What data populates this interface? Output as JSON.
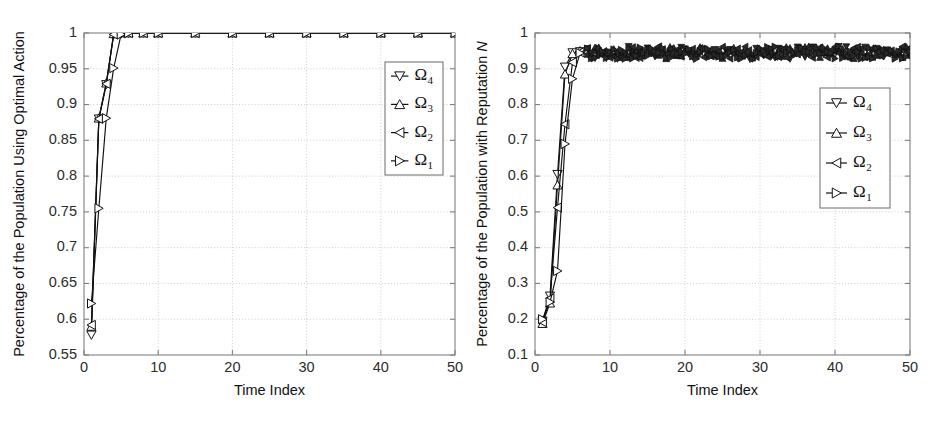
{
  "figure": {
    "background": "#ffffff",
    "panel_count": 2,
    "line_color": "#111111",
    "grid_color": "#c8c8c8",
    "axis_color": "#808080"
  },
  "chart_data": [
    {
      "id": "left",
      "type": "line",
      "title": "",
      "xlabel": "Time Index",
      "ylabel": "Percentage of the Population Using Optimal Action",
      "ylabel_italic_suffix": "",
      "xlim": [
        0,
        50
      ],
      "ylim": [
        0.55,
        1.0
      ],
      "xticks": [
        0,
        10,
        20,
        30,
        40,
        50
      ],
      "xticklabels": [
        "0",
        "10",
        "20",
        "30",
        "40",
        "50"
      ],
      "yticks": [
        0.55,
        0.6,
        0.65,
        0.7,
        0.75,
        0.8,
        0.85,
        0.9,
        0.95,
        1
      ],
      "yticklabels": [
        "0.55",
        "0.6",
        "0.65",
        "0.7",
        "0.75",
        "0.8",
        "0.85",
        "0.9",
        "0.95",
        "1"
      ],
      "grid": true,
      "grid_style": "dotted",
      "legend_position": "upper-right-inset",
      "series": [
        {
          "name": "Ω4",
          "marker": "triangle-down",
          "x": [
            1,
            2,
            3,
            4,
            5,
            6,
            8,
            10,
            15,
            20,
            25,
            30,
            35,
            40,
            45,
            50
          ],
          "y": [
            0.578,
            0.88,
            0.928,
            0.998,
            0.999,
            1.0,
            1.0,
            1.0,
            1.0,
            1.0,
            1.0,
            1.0,
            1.0,
            1.0,
            1.0,
            1.0
          ]
        },
        {
          "name": "Ω3",
          "marker": "triangle-up",
          "x": [
            1,
            2,
            3,
            4,
            5,
            6,
            8,
            10,
            15,
            20,
            25,
            30,
            35,
            40,
            45,
            50
          ],
          "y": [
            0.59,
            0.881,
            0.93,
            0.999,
            1.0,
            1.0,
            1.0,
            1.0,
            1.0,
            1.0,
            1.0,
            1.0,
            1.0,
            1.0,
            1.0,
            1.0
          ]
        },
        {
          "name": "Ω2",
          "marker": "triangle-left",
          "x": [
            1,
            2,
            3,
            4,
            5,
            6,
            8,
            10,
            15,
            20,
            25,
            30,
            35,
            40,
            45,
            50
          ],
          "y": [
            0.592,
            0.88,
            0.929,
            0.998,
            1.0,
            1.0,
            1.0,
            1.0,
            1.0,
            1.0,
            1.0,
            1.0,
            1.0,
            1.0,
            1.0,
            1.0
          ]
        },
        {
          "name": "Ω1",
          "marker": "triangle-right",
          "x": [
            1,
            2,
            3,
            4,
            5,
            6,
            8,
            10,
            15,
            20,
            25,
            30,
            35,
            40,
            45,
            50
          ],
          "y": [
            0.622,
            0.755,
            0.881,
            0.951,
            0.998,
            1.0,
            1.0,
            1.0,
            1.0,
            1.0,
            1.0,
            1.0,
            1.0,
            1.0,
            1.0,
            1.0
          ]
        }
      ]
    },
    {
      "id": "right",
      "type": "line",
      "title": "",
      "xlabel": "Time Index",
      "ylabel": "Percentage of the Population with Reputation ",
      "ylabel_italic_suffix": "N",
      "xlim": [
        0,
        50
      ],
      "ylim": [
        0.1,
        1.0
      ],
      "xticks": [
        0,
        10,
        20,
        30,
        40,
        50
      ],
      "xticklabels": [
        "0",
        "10",
        "20",
        "30",
        "40",
        "50"
      ],
      "yticks": [
        0.1,
        0.2,
        0.3,
        0.4,
        0.5,
        0.6,
        0.7,
        0.8,
        0.9,
        1
      ],
      "yticklabels": [
        "0.1",
        "0.2",
        "0.3",
        "0.4",
        "0.5",
        "0.6",
        "0.7",
        "0.8",
        "0.9",
        "1"
      ],
      "grid": true,
      "grid_style": "dotted",
      "legend_position": "right-inset",
      "plateau_level": 0.945,
      "plateau_noise": 0.018,
      "series": [
        {
          "name": "Ω4",
          "marker": "triangle-down",
          "x": [
            1,
            2,
            3,
            4,
            5,
            6
          ],
          "y": [
            0.195,
            0.265,
            0.605,
            0.905,
            0.945,
            0.948
          ]
        },
        {
          "name": "Ω3",
          "marker": "triangle-up",
          "x": [
            1,
            2,
            3,
            4,
            5,
            6
          ],
          "y": [
            0.188,
            0.245,
            0.575,
            0.885,
            0.942,
            0.95
          ]
        },
        {
          "name": "Ω2",
          "marker": "triangle-left",
          "x": [
            1,
            2,
            3,
            4,
            5,
            6
          ],
          "y": [
            0.192,
            0.258,
            0.512,
            0.745,
            0.918,
            0.946
          ]
        },
        {
          "name": "Ω1",
          "marker": "triangle-right",
          "x": [
            1,
            2,
            3,
            4,
            5,
            6
          ],
          "y": [
            0.2,
            0.248,
            0.335,
            0.69,
            0.872,
            0.944
          ]
        }
      ]
    }
  ],
  "legend": {
    "entries": [
      {
        "label": "Ω",
        "sub": "4",
        "marker": "triangle-down"
      },
      {
        "label": "Ω",
        "sub": "3",
        "marker": "triangle-up"
      },
      {
        "label": "Ω",
        "sub": "2",
        "marker": "triangle-left"
      },
      {
        "label": "Ω",
        "sub": "1",
        "marker": "triangle-right"
      }
    ]
  }
}
